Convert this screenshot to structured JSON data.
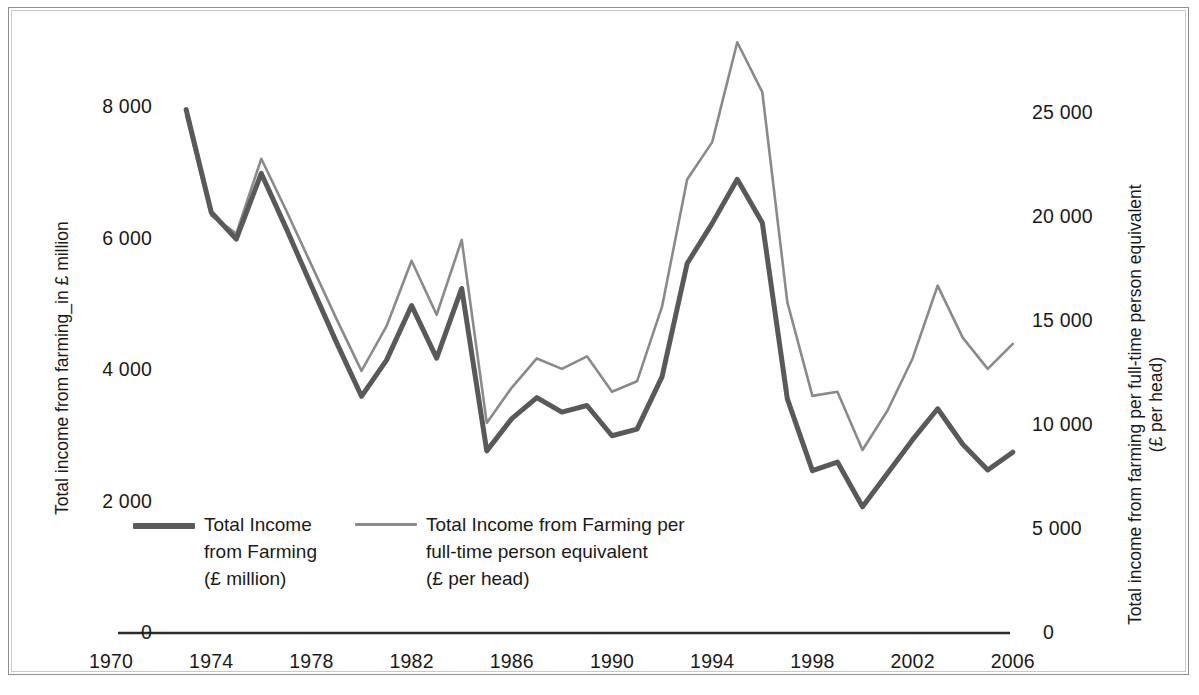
{
  "figure": {
    "title": "",
    "background": "#ffffff",
    "frame_color": "#8f8f8f"
  },
  "left_axis": {
    "title_line1": "Total income from farming_in £ million",
    "ticks": [
      "8 000",
      "6 000",
      "4 000",
      "2 000",
      "0"
    ]
  },
  "right_axis": {
    "title_line1": "Total income from farming per full-time person equivalent",
    "title_line2": "(£ per head)",
    "ticks": [
      "25 000",
      "20 000",
      "15 000",
      "10 000",
      "5 000",
      "0"
    ]
  },
  "x_axis": {
    "ticks": [
      "1970",
      "1974",
      "1978",
      "1982",
      "1986",
      "1990",
      "1994",
      "1998",
      "2002",
      "2006"
    ]
  },
  "legend": {
    "items": [
      {
        "name": "total-income-from-farming",
        "color": "#595959",
        "line1": "Total Income",
        "line2": "from Farming",
        "line3": "(£ million)"
      },
      {
        "name": "total-income-per-person",
        "color": "#8a8a8a",
        "line1": "Total Income from Farming per",
        "line2": "full-time person equivalent",
        "line3": "(£ per head)"
      }
    ]
  },
  "chart_data": {
    "type": "line",
    "title": "",
    "xlabel": "",
    "ylabel": "Total income from farming_in £ million",
    "y2label": "Total income from farming per full-time person equivalent (£ per head)",
    "grid": false,
    "legend_position": "inside-bottom-left",
    "xlim": [
      1970,
      2006
    ],
    "xticks": [
      1970,
      1974,
      1978,
      1982,
      1986,
      1990,
      1994,
      1998,
      2002,
      2006
    ],
    "ylim": [
      0,
      8000
    ],
    "yticks": [
      0,
      2000,
      4000,
      6000,
      8000
    ],
    "y2lim": [
      0,
      25000
    ],
    "y2ticks": [
      0,
      5000,
      10000,
      15000,
      20000,
      25000
    ],
    "x": [
      1973,
      1974,
      1975,
      1976,
      1977,
      1978,
      1979,
      1980,
      1981,
      1982,
      1983,
      1984,
      1985,
      1986,
      1987,
      1988,
      1989,
      1990,
      1991,
      1992,
      1993,
      1994,
      1995,
      1996,
      1997,
      1998,
      1999,
      2000,
      2001,
      2002,
      2003,
      2004,
      2005,
      2006
    ],
    "series": [
      {
        "name": "Total Income from Farming (£ million)",
        "axis": "left",
        "color": "#595959",
        "line_width": 5,
        "units": "£ million",
        "values": [
          7960,
          6400,
          5990,
          6990,
          6150,
          5280,
          4420,
          3600,
          4150,
          4980,
          4180,
          5240,
          2770,
          3260,
          3580,
          3360,
          3460,
          3000,
          3100,
          3900,
          5620,
          6230,
          6900,
          6240,
          3560,
          2470,
          2600,
          1920,
          2430,
          2940,
          3410,
          2870,
          2480,
          2750
        ]
      },
      {
        "name": "Total Income from Farming per full-time person equivalent (£ per head)",
        "axis": "right",
        "color": "#8a8a8a",
        "line_width": 2.6,
        "units": "£ per head",
        "values": [
          24880,
          20080,
          19200,
          22800,
          20300,
          17700,
          15100,
          12600,
          14750,
          17900,
          15300,
          18900,
          10100,
          11800,
          13200,
          12700,
          13300,
          11600,
          12100,
          15700,
          21800,
          23600,
          28400,
          26000,
          15900,
          11400,
          11600,
          8800,
          10700,
          13200,
          16700,
          14200,
          12700,
          13900
        ]
      }
    ]
  }
}
